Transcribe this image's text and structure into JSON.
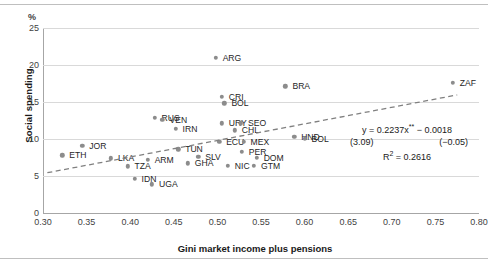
{
  "chart_data": {
    "type": "scatter",
    "title": "",
    "xlabel": "Gini market income plus pensions",
    "ylabel": "Social spending",
    "yunit": "%",
    "xlim": [
      0.3,
      0.8
    ],
    "ylim": [
      0,
      25
    ],
    "xticks": [
      "0.30",
      "0.35",
      "0.40",
      "0.45",
      "0.50",
      "0.55",
      "0.60",
      "0.65",
      "0.70",
      "0.75",
      "0.80"
    ],
    "yticks": [
      "0",
      "5",
      "10",
      "15",
      "20",
      "25"
    ],
    "grid": "horizontal",
    "legend": "none",
    "marker_color": "#8c8c8c",
    "trendline": {
      "style": "dashed",
      "color": "#808080",
      "slope": 0.2237,
      "intercept": -0.0018,
      "x_start": 0.305,
      "x_end": 0.775
    },
    "annotation": {
      "equation": "y = 0.2237x** − 0.0018",
      "equation_prefix": "y = 0.2237x",
      "equation_stars": "**",
      "equation_suffix": " − 0.0018",
      "tstat_slope": "(3.09)",
      "tstat_intercept": "(−0.05)",
      "r_squared_label": "R",
      "r_squared_sup": "2",
      "r_squared_value": " = 0.2616"
    },
    "points": [
      {
        "label": "ETH",
        "x": 0.322,
        "y": 7.8,
        "lx": 7,
        "ly": 0
      },
      {
        "label": "JOR",
        "x": 0.345,
        "y": 9.1,
        "lx": 7,
        "ly": 0
      },
      {
        "label": "LKA",
        "x": 0.378,
        "y": 7.4,
        "lx": 7,
        "ly": 0
      },
      {
        "label": "TZA",
        "x": 0.397,
        "y": 6.3,
        "lx": 7,
        "ly": 0
      },
      {
        "label": "IDN",
        "x": 0.405,
        "y": 4.6,
        "lx": 7,
        "ly": 0
      },
      {
        "label": "UGA",
        "x": 0.425,
        "y": 3.9,
        "lx": 7,
        "ly": 0
      },
      {
        "label": "ARM",
        "x": 0.42,
        "y": 7.2,
        "lx": 7,
        "ly": 0
      },
      {
        "label": "RUS",
        "x": 0.428,
        "y": 12.9,
        "lx": 7,
        "ly": 0
      },
      {
        "label": "VEN",
        "x": 0.437,
        "y": 12.6,
        "lx": 7,
        "ly": 0
      },
      {
        "label": "IRN",
        "x": 0.452,
        "y": 11.4,
        "lx": 7,
        "ly": 0
      },
      {
        "label": "TUN",
        "x": 0.455,
        "y": 8.6,
        "lx": 7,
        "ly": 0
      },
      {
        "label": "GHA",
        "x": 0.466,
        "y": 6.7,
        "lx": 7,
        "ly": 0
      },
      {
        "label": "SLV",
        "x": 0.478,
        "y": 7.6,
        "lx": 7,
        "ly": 0
      },
      {
        "label": "ARG",
        "x": 0.498,
        "y": 21.0,
        "lx": 7,
        "ly": 0
      },
      {
        "label": "CRI",
        "x": 0.505,
        "y": 15.7,
        "lx": 7,
        "ly": 0
      },
      {
        "label": "BOL",
        "x": 0.508,
        "y": 14.8,
        "lx": 7,
        "ly": 0
      },
      {
        "label": "URY",
        "x": 0.505,
        "y": 12.1,
        "lx": 7,
        "ly": 0
      },
      {
        "label": "SEO",
        "x": 0.527,
        "y": 12.1,
        "lx": 7,
        "ly": 0
      },
      {
        "label": "CHL",
        "x": 0.52,
        "y": 11.2,
        "lx": 7,
        "ly": 0
      },
      {
        "label": "ECU",
        "x": 0.502,
        "y": 9.6,
        "lx": 7,
        "ly": 0
      },
      {
        "label": "MEX",
        "x": 0.53,
        "y": 9.6,
        "lx": 7,
        "ly": 0
      },
      {
        "label": "PER",
        "x": 0.528,
        "y": 8.3,
        "lx": 7,
        "ly": 0
      },
      {
        "label": "DOM",
        "x": 0.545,
        "y": 7.5,
        "lx": 7,
        "ly": 0
      },
      {
        "label": "NIC",
        "x": 0.512,
        "y": 6.4,
        "lx": 7,
        "ly": 0
      },
      {
        "label": "GTM",
        "x": 0.542,
        "y": 6.4,
        "lx": 7,
        "ly": 0
      },
      {
        "label": "BRA",
        "x": 0.578,
        "y": 17.1,
        "lx": 7,
        "ly": 0
      },
      {
        "label": "HND",
        "x": 0.588,
        "y": 10.3,
        "lx": 7,
        "ly": 0
      },
      {
        "label": "BOL2",
        "x": 0.6,
        "y": 10.0,
        "lx": 7,
        "ly": 0
      },
      {
        "label": "ZAF",
        "x": 0.77,
        "y": 17.6,
        "lx": 7,
        "ly": 0
      }
    ],
    "point_labels_display": {
      "BOL2": "BOL"
    }
  }
}
